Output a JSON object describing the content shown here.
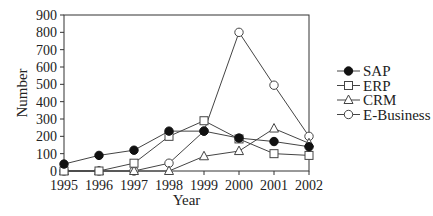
{
  "chart_data": {
    "type": "line",
    "title": "",
    "xlabel": "Year",
    "ylabel": "Number",
    "x": [
      "1995",
      "1996",
      "1997",
      "1998",
      "1999",
      "2000",
      "2001",
      "2002"
    ],
    "ylim": [
      0,
      900
    ],
    "yticks": [
      0,
      100,
      200,
      300,
      400,
      500,
      600,
      700,
      800,
      900
    ],
    "grid": false,
    "legend_position": "right",
    "series": [
      {
        "name": "SAP",
        "marker": "filled-circle",
        "values": [
          40,
          90,
          120,
          230,
          230,
          190,
          170,
          140
        ]
      },
      {
        "name": "ERP",
        "marker": "open-square",
        "values": [
          0,
          0,
          45,
          200,
          290,
          185,
          100,
          90
        ]
      },
      {
        "name": "CRM",
        "marker": "open-triangle",
        "values": [
          0,
          0,
          0,
          0,
          85,
          115,
          245,
          160
        ]
      },
      {
        "name": "E-Business",
        "marker": "open-circle",
        "values": [
          0,
          0,
          0,
          45,
          230,
          800,
          495,
          200
        ]
      }
    ]
  },
  "colors": {
    "line": "#444444",
    "axis": "#333333"
  }
}
